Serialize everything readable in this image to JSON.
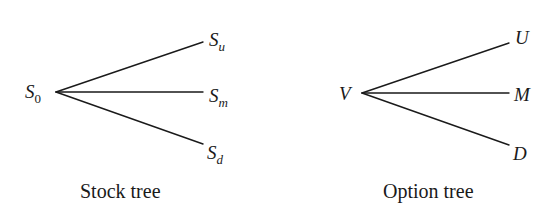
{
  "diagrams": [
    {
      "id": "stock-tree",
      "caption": "Stock tree",
      "root": {
        "base": "S",
        "sub": "0"
      },
      "branches": [
        {
          "base": "S",
          "sub": "u"
        },
        {
          "base": "S",
          "sub": "m"
        },
        {
          "base": "S",
          "sub": "d"
        }
      ]
    },
    {
      "id": "option-tree",
      "caption": "Option tree",
      "root": {
        "base": "V",
        "sub": ""
      },
      "branches": [
        {
          "base": "U",
          "sub": ""
        },
        {
          "base": "M",
          "sub": ""
        },
        {
          "base": "D",
          "sub": ""
        }
      ]
    }
  ],
  "colors": {
    "line": "#1a1a1a",
    "text": "#1a1a1a",
    "background": "#ffffff"
  }
}
